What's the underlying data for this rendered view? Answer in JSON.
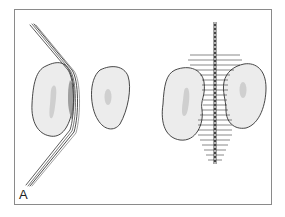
{
  "figure": {
    "panel_label": "A",
    "colors": {
      "border": "#8a8a8a",
      "cell_fill": "#ececec",
      "cell_stroke": "#333333",
      "nucleus_fill": "#cfcfcf",
      "suture": "#444444",
      "brush": "#1a1a1a"
    }
  }
}
